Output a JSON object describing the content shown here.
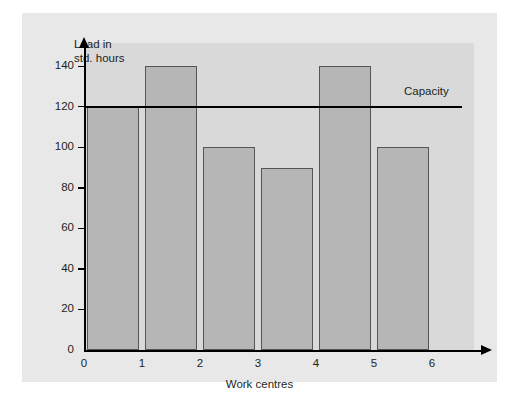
{
  "chart_data": {
    "type": "bar",
    "title": "",
    "xlabel": "Work centres",
    "ylabel": "Load in\nstd. hours",
    "categories": [
      "1",
      "2",
      "3",
      "4",
      "5",
      "6"
    ],
    "values": [
      120,
      140,
      100,
      90,
      140,
      100
    ],
    "ylim": [
      0,
      150
    ],
    "yticks": [
      0,
      20,
      40,
      60,
      80,
      100,
      120,
      140
    ],
    "ytick_labels": [
      "0",
      "20",
      "40",
      "60",
      "80",
      "100",
      "120",
      "140"
    ],
    "xtick_labels": [
      "0",
      "1",
      "2",
      "3",
      "4",
      "5",
      "6"
    ],
    "grid": false,
    "legend_position": "none",
    "annotations": [
      {
        "name": "capacity",
        "label": "Capacity",
        "type": "horizontal-line",
        "value": 120
      }
    ],
    "colors": {
      "bar_fill": "#b6b6b6",
      "bar_stroke": "#555555",
      "axis": "#000000",
      "text": "#231f20",
      "panel_background": "#e8e8e8",
      "plot_background": "#d9d9d9",
      "capacity_line": "#000000"
    }
  }
}
